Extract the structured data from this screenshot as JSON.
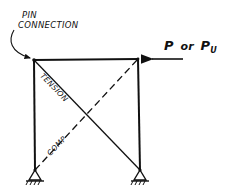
{
  "diagram": {
    "labels": {
      "pin_connection_line1": "PIN",
      "pin_connection_line2": "CONNECTION",
      "load_p": "P",
      "load_or": "or",
      "load_pu_base": "P",
      "load_pu_sub": "U",
      "tension": "TENSION",
      "comp": "COMP"
    },
    "nodes": {
      "top_left": [
        34,
        60
      ],
      "top_right": [
        138,
        59
      ],
      "bottom_left": [
        35,
        170
      ],
      "bottom_right": [
        140,
        170
      ]
    },
    "members": [
      {
        "name": "left-column",
        "from": "bottom_left",
        "to": "top_left",
        "style": "solid"
      },
      {
        "name": "right-column",
        "from": "bottom_right",
        "to": "top_right",
        "style": "solid"
      },
      {
        "name": "top-beam",
        "from": "top_left",
        "to": "top_right",
        "style": "solid"
      },
      {
        "name": "tension-brace",
        "from": "top_left",
        "to": "bottom_right",
        "style": "solid-thin",
        "force": "TENSION"
      },
      {
        "name": "compression-brace",
        "from": "bottom_left",
        "to": "top_right",
        "style": "dashed",
        "force": "COMP"
      }
    ],
    "supports": [
      {
        "name": "left-pin-support",
        "node": "bottom_left",
        "type": "pinned"
      },
      {
        "name": "right-pin-support",
        "node": "bottom_right",
        "type": "pinned"
      }
    ],
    "load": {
      "direction": "leftward",
      "applied_at": "top_right",
      "arrow_from": [
        175,
        59
      ],
      "arrow_to": [
        146,
        59
      ]
    },
    "colors": {
      "ink": "#111111",
      "background": "#ffffff"
    }
  }
}
